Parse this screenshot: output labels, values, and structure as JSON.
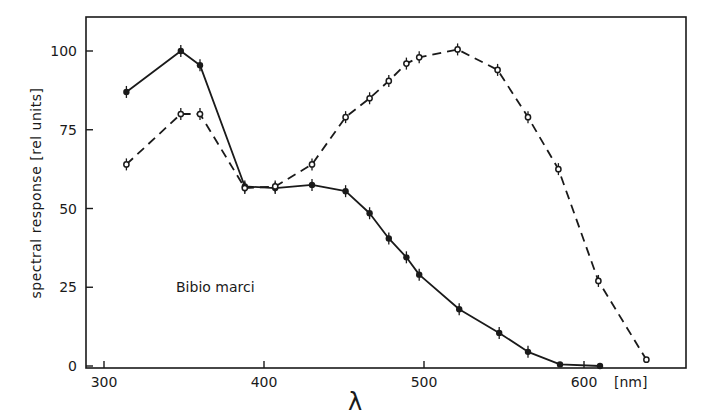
{
  "chart_data": {
    "type": "line",
    "title": "",
    "xlabel": "λ",
    "x_unit": "[nm]",
    "ylabel": "spectral response [rel units]",
    "xlim": [
      289,
      676
    ],
    "ylim": [
      0,
      110
    ],
    "x_ticks": [
      300,
      400,
      500,
      600
    ],
    "y_ticks": [
      0,
      25,
      50,
      75,
      100
    ],
    "grid": false,
    "legend": null,
    "annotations": [
      {
        "text": "Bibio marci",
        "x": 330,
        "y": 27
      }
    ],
    "series": [
      {
        "name": "solid",
        "style": "solid",
        "marker": "filled-circle-errorbar",
        "x": [
          314,
          348,
          360,
          388,
          407,
          430,
          451,
          466,
          478,
          489,
          497,
          522,
          547,
          565,
          585,
          610
        ],
        "y": [
          87,
          100,
          95.5,
          57,
          56.5,
          57.5,
          55.5,
          48.5,
          40.5,
          34.5,
          29,
          18,
          10.5,
          4.5,
          0.5,
          0
        ]
      },
      {
        "name": "dashed",
        "style": "dashed",
        "marker": "open-circle-errorbar",
        "x": [
          314,
          348,
          360,
          388,
          407,
          430,
          451,
          466,
          478,
          489,
          497,
          521,
          546,
          565,
          584,
          609,
          639
        ],
        "y": [
          64,
          80,
          80,
          56.5,
          57,
          64,
          79,
          85,
          90.5,
          96,
          98,
          100.5,
          94,
          79,
          62.5,
          27,
          2
        ]
      }
    ]
  },
  "labels": {
    "y_axis_title": "spectral response [rel units]",
    "x_axis_title": "λ",
    "x_unit": "[nm]",
    "species": "Bibio marci",
    "x_tick_labels": [
      "300",
      "400",
      "500",
      "600"
    ],
    "y_tick_labels": [
      "0",
      "25",
      "50",
      "75",
      "100"
    ]
  },
  "colors": {
    "ink": "#1a1a1a",
    "background": "#ffffff"
  }
}
